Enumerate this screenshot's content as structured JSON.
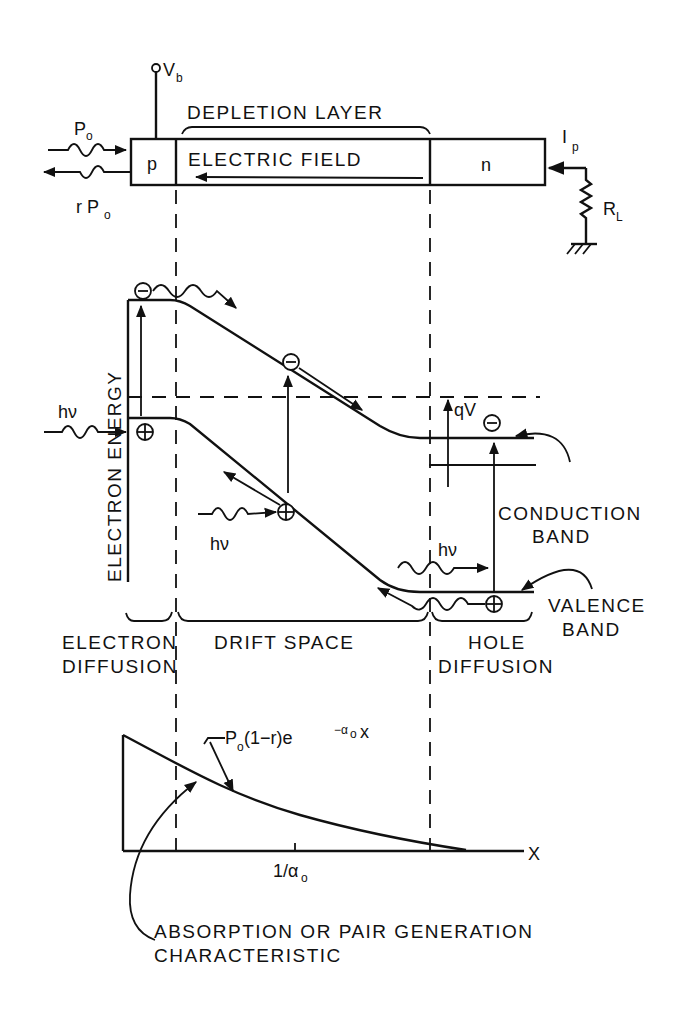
{
  "diagram": {
    "type": "p-i-n photodiode operation / energy band diagram",
    "colors": {
      "ink": "#111111",
      "background": "#ffffff"
    }
  },
  "device": {
    "bias_label": "V",
    "bias_subscript": "b",
    "incident_power": "P",
    "incident_power_subscript": "o",
    "reflected_power_prefix": "r P",
    "reflected_power_subscript": "o",
    "depletion_label": "DEPLETION LAYER",
    "field_label": "ELECTRIC FIELD",
    "p_region": "p",
    "n_region": "n",
    "current_label": "I",
    "current_subscript": "p",
    "load_label": "R",
    "load_subscript": "L"
  },
  "band_diagram": {
    "axis_label": "ELECTRON ENERGY",
    "photon_label_1": "hν",
    "photon_label_2": "hν",
    "photon_label_3": "hν",
    "voltage_label": "qV",
    "electron_symbol": "⊖",
    "hole_symbol": "⊕",
    "conduction_band_line1": "CONDUCTION",
    "conduction_band_line2": "BAND",
    "valence_band_line1": "VALENCE",
    "valence_band_line2": "BAND"
  },
  "regions": {
    "electron_diffusion_line1": "ELECTRON",
    "electron_diffusion_line2": "DIFFUSION",
    "drift_space": "DRIFT SPACE",
    "hole_diffusion_line1": "HOLE",
    "hole_diffusion_line2": "DIFFUSION"
  },
  "absorption": {
    "formula_prefix": "P",
    "formula_prefix_sub": "o",
    "formula_mid": " (1−r)e",
    "formula_exp": "−α",
    "formula_exp_sub": "o",
    "formula_exp_tail": "x",
    "x_axis_label": "X",
    "tick_label": "1/α",
    "tick_label_sub": "o",
    "caption_line1": "ABSORPTION OR PAIR GENERATION",
    "caption_line2": "CHARACTERISTIC"
  }
}
